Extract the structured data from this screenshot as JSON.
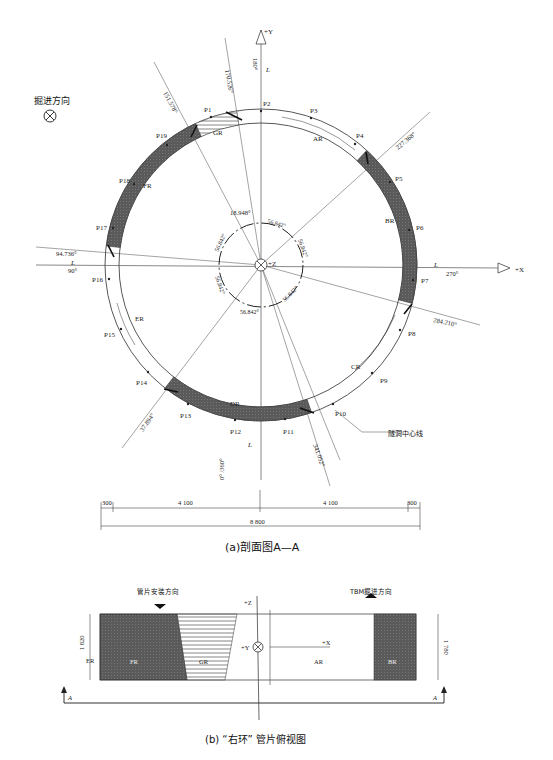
{
  "section_a": {
    "caption": "(a)剖面图A—A",
    "direction_label": "掘进方向",
    "axes": {
      "plus_y": "+Y",
      "plus_x": "+X",
      "plus_z": "+Z"
    },
    "segments": [
      "AR",
      "BR",
      "CR",
      "DR",
      "ER",
      "FR",
      "GR"
    ],
    "points": [
      "P1",
      "P2",
      "P3",
      "P4",
      "P5",
      "P6",
      "P7",
      "P8",
      "P9",
      "P10",
      "P11",
      "P12",
      "P13",
      "P14",
      "P15",
      "P16",
      "P17",
      "P18",
      "P19"
    ],
    "angles": {
      "a180": "180°",
      "a170": "170.526°",
      "a151": "151.578°",
      "a227": "227.368°",
      "a270": "270°",
      "a284": "284.210°",
      "a341": "341.052°",
      "a0": "0° /360°",
      "a37": "37.894°",
      "a90": "90°",
      "a94": "94.736°",
      "a18": "18.948°",
      "inner": "56.842°"
    },
    "l_labels": {
      "top": "L_seal",
      "left": "L_seal",
      "right": "L_seal",
      "bottom": "L_seal",
      "sub": "seal"
    },
    "tunnel_centerline": "隧洞中心线",
    "dims": {
      "d300_left": "300",
      "d4100_left": "4 100",
      "d4100_right": "4 100",
      "d300_right": "300",
      "d8800": "8 800"
    }
  },
  "section_b": {
    "caption": "(b) “右环” 管片俯视图",
    "install_direction": "管片安装方向",
    "tbm_direction": "TBM掘进方向",
    "labels": {
      "er": "ER",
      "fr": "FR",
      "gr": "GR",
      "ar": "AR",
      "br": "BR",
      "plus_z": "+Z",
      "plus_y": "+Y",
      "plus_x": "+X",
      "a_left": "A",
      "a_right": "A"
    },
    "dims": {
      "left": "1 820",
      "right": "1 780",
      "mid": "1 800"
    }
  }
}
